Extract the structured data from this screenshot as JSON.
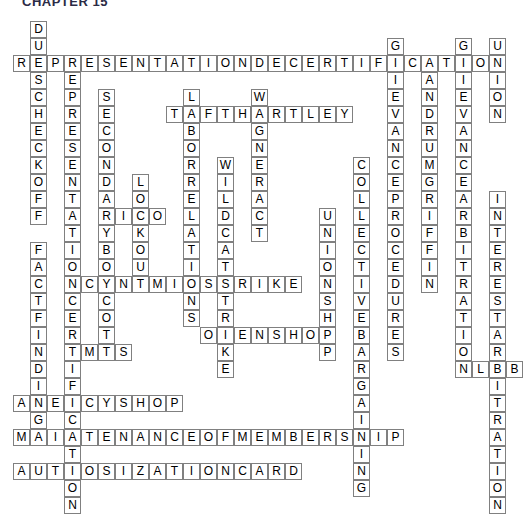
{
  "page": {
    "title": "CHAPTER 15",
    "background_color": "#ffffff",
    "title_color": "#2b2b45"
  },
  "grid": {
    "cell_size": 17,
    "origin_x": 13,
    "origin_y": 21,
    "cols": 29,
    "rows": 28,
    "cell_border_color": "#808080",
    "cell_fill_color": "#ffffff",
    "letter_color": "#000000"
  },
  "entries": [
    {
      "name": "dues-checkoff",
      "answer": "DUESCHECKOFF",
      "direction": "down",
      "col": 1,
      "row": 0
    },
    {
      "name": "representation-decertification",
      "answer": "REPRESENTATIONDECERTIFICATION",
      "direction": "across",
      "col": 0,
      "row": 2
    },
    {
      "name": "representation-certification",
      "answer": "REPRESENTATIONCERTIFICATION",
      "direction": "down",
      "col": 3,
      "row": 2
    },
    {
      "name": "secondary-boycott",
      "answer": "SECONDARYBOYCOTT",
      "direction": "down",
      "col": 5,
      "row": 4
    },
    {
      "name": "lockout",
      "answer": "LOCKOUT",
      "direction": "down",
      "col": 7,
      "row": 9
    },
    {
      "name": "rico",
      "answer": "RICO",
      "direction": "across",
      "col": 5,
      "row": 11
    },
    {
      "name": "labor-relations",
      "answer": "LABORRELATIONS",
      "direction": "down",
      "col": 10,
      "row": 4
    },
    {
      "name": "taft-hartley",
      "answer": "TAFTHARTLEY",
      "direction": "across",
      "col": 9,
      "row": 5
    },
    {
      "name": "wagner-act",
      "answer": "WAGNERACT",
      "direction": "down",
      "col": 14,
      "row": 4
    },
    {
      "name": "wildcat-strike",
      "answer": "WILDCATSTRIKE",
      "direction": "down",
      "col": 12,
      "row": 8
    },
    {
      "name": "economic-strike",
      "answer": "ECONOMICSTRIKE",
      "direction": "across",
      "col": 3,
      "row": 15
    },
    {
      "name": "open-shop",
      "answer": "OPENSHOP",
      "direction": "across",
      "col": 11,
      "row": 18
    },
    {
      "name": "union-shop",
      "answer": "UNIONSHOP",
      "direction": "down",
      "col": 18,
      "row": 11
    },
    {
      "name": "collective-bargaining",
      "answer": "COLLECTIVEBARGAINING",
      "direction": "down",
      "col": 20,
      "row": 8
    },
    {
      "name": "grievance-procedures",
      "answer": "GRIEVANCEPROCEDURES",
      "direction": "down",
      "col": 22,
      "row": 1
    },
    {
      "name": "landrum-griffin",
      "answer": "LANDRUMGRIFFIN",
      "direction": "down",
      "col": 24,
      "row": 2
    },
    {
      "name": "grievance-arbitration",
      "answer": "GRIEVANCEARBITRATION",
      "direction": "down",
      "col": 26,
      "row": 1
    },
    {
      "name": "union",
      "answer": "UNION",
      "direction": "down",
      "col": 28,
      "row": 1
    },
    {
      "name": "interest-arbitration",
      "answer": "INTERESTARBITRATION",
      "direction": "down",
      "col": 28,
      "row": 10
    },
    {
      "name": "lrb",
      "answer": "LRB",
      "direction": "across",
      "col": 27,
      "row": 20
    },
    {
      "name": "fact-finding",
      "answer": "FACTFINDING",
      "direction": "down",
      "col": 1,
      "row": 13
    },
    {
      "name": "fmcs",
      "answer": "FMCS",
      "direction": "across",
      "col": 3,
      "row": 19
    },
    {
      "name": "agency-shop",
      "answer": "AGENCYSHOP",
      "direction": "across",
      "col": 0,
      "row": 22
    },
    {
      "name": "maintenance-of-membership",
      "answer": "MAINTENANCEOFMEMBERSHIP",
      "direction": "across",
      "col": 0,
      "row": 24
    },
    {
      "name": "authosization-card",
      "answer": "AUTHOSIZATIONCARD",
      "direction": "across",
      "col": 0,
      "row": 26
    }
  ]
}
